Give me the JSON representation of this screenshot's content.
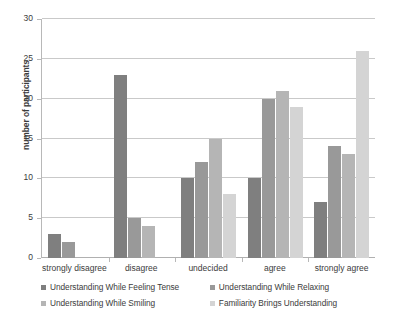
{
  "chart_data": {
    "type": "bar",
    "title": "",
    "xlabel": "",
    "ylabel": "number of participants",
    "ylim": [
      0,
      30
    ],
    "ytick_step": 5,
    "yticks": [
      0,
      5,
      10,
      15,
      20,
      25,
      30
    ],
    "grid": true,
    "legend_position": "bottom",
    "categories": [
      "strongly disagree",
      "disagree",
      "undecided",
      "agree",
      "strongly agree"
    ],
    "series": [
      {
        "name": "Understanding While Feeling Tense",
        "color": "#7f7f7f",
        "values": [
          3,
          23,
          10,
          10,
          7
        ]
      },
      {
        "name": "Understanding While Relaxing",
        "color": "#999999",
        "values": [
          2,
          5,
          12,
          20,
          14
        ]
      },
      {
        "name": "Understanding While Smiling",
        "color": "#b5b5b5",
        "values": [
          0,
          4,
          15,
          21,
          13
        ]
      },
      {
        "name": "Familiarity Brings Understanding",
        "color": "#d4d4d4",
        "values": [
          0,
          0,
          8,
          19,
          26
        ]
      }
    ]
  },
  "axis": {
    "y_title": "number of participants",
    "tick_labels": [
      "30",
      "25",
      "20",
      "15",
      "10",
      "5",
      "0"
    ]
  },
  "legend": {
    "items": [
      "Understanding While Feeling Tense",
      "Understanding While Relaxing",
      "Understanding While Smiling",
      "Familiarity Brings Understanding"
    ]
  },
  "colors": {
    "series_1": "#7f7f7f",
    "series_2": "#999999",
    "series_3": "#b5b5b5",
    "series_4": "#d4d4d4",
    "gridline": "#c9c9c9",
    "axis": "#b8b8b8",
    "text": "#3b3b3b"
  }
}
